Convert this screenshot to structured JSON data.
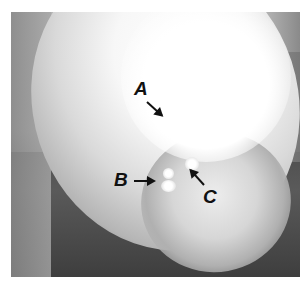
{
  "figure": {
    "type": "dental radiograph",
    "colors": {
      "background": "#ffffff",
      "film_dark": "#4a4a4a",
      "label": "#111111"
    },
    "labels": [
      {
        "id": "A",
        "text": "A"
      },
      {
        "id": "B",
        "text": "B"
      },
      {
        "id": "C",
        "text": "C"
      }
    ]
  }
}
